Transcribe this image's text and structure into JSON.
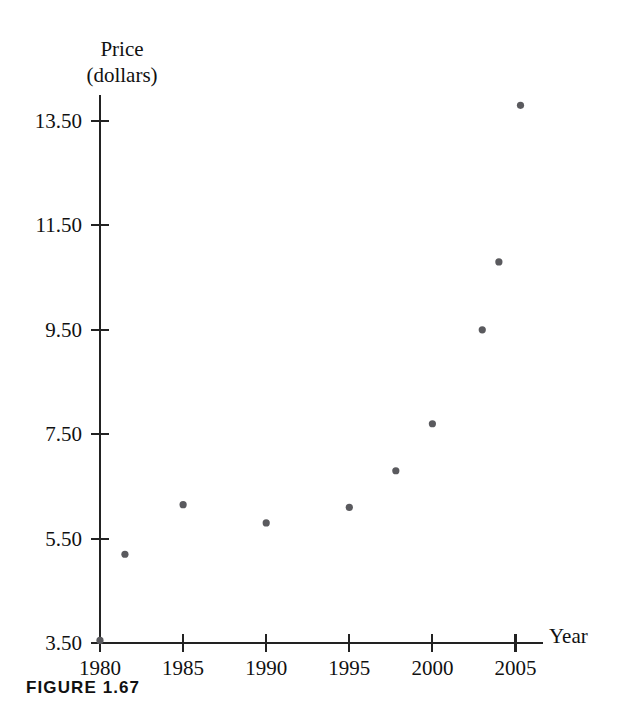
{
  "figure": {
    "caption": "FIGURE 1.67"
  },
  "chart_data": {
    "type": "scatter",
    "title": "",
    "subtitle": "",
    "xlabel": "Year",
    "ylabel": "Price (dollars)",
    "ylabel_lines": [
      "Price",
      "(dollars)"
    ],
    "xlim": [
      1980,
      2006.5
    ],
    "ylim": [
      3.5,
      14.3
    ],
    "grid": false,
    "legend": null,
    "x_ticks": [
      1980,
      1985,
      1990,
      1995,
      2000,
      2005
    ],
    "x_tick_labels": [
      "1980",
      "1985",
      "1990",
      "1995",
      "2000",
      "2005"
    ],
    "y_ticks": [
      3.5,
      5.5,
      7.5,
      9.5,
      11.5,
      13.5
    ],
    "y_tick_labels": [
      "3.50",
      "5.50",
      "7.50",
      "9.50",
      "11.50",
      "13.50"
    ],
    "point_color": "#5a5a5e",
    "axis_color": "#222222",
    "x": [
      1980,
      1981.5,
      1985,
      1990,
      1995,
      1997.8,
      2000,
      2003,
      2004,
      2005.3
    ],
    "y": [
      3.55,
      5.2,
      6.15,
      5.8,
      6.1,
      6.8,
      7.7,
      9.5,
      10.8,
      13.8
    ],
    "points": [
      {
        "x": 1980,
        "y": 3.55
      },
      {
        "x": 1981.5,
        "y": 5.2
      },
      {
        "x": 1985,
        "y": 6.15
      },
      {
        "x": 1990,
        "y": 5.8
      },
      {
        "x": 1995,
        "y": 6.1
      },
      {
        "x": 1997.8,
        "y": 6.8
      },
      {
        "x": 2000,
        "y": 7.7
      },
      {
        "x": 2003,
        "y": 9.5
      },
      {
        "x": 2004,
        "y": 10.8
      },
      {
        "x": 2005.3,
        "y": 13.8
      }
    ]
  }
}
